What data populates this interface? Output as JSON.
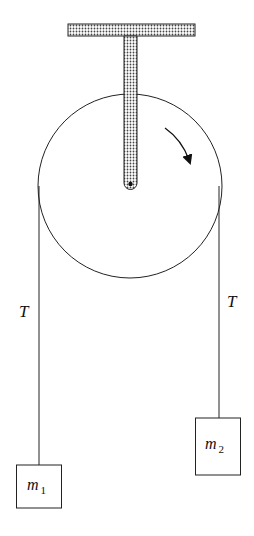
{
  "diagram": {
    "type": "atwood-machine",
    "labels": {
      "left_tension": "T",
      "right_tension": "T",
      "mass_left": {
        "symbol": "m",
        "subscript": "1"
      },
      "mass_right": {
        "symbol": "m",
        "subscript": "2"
      }
    },
    "rotation_direction": "clockwise",
    "colors": {
      "line": "#222222",
      "hatch": "#555555",
      "background": "#ffffff"
    }
  }
}
